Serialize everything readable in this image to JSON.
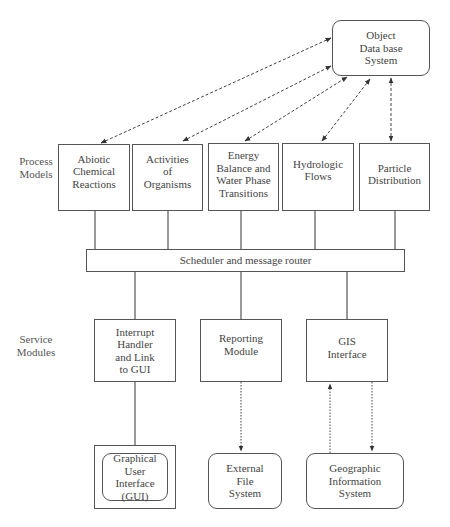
{
  "rows": {
    "process_label": "Process\nModels",
    "service_label": "Service\nModules"
  },
  "database": {
    "label": "Object\nData base\nSystem"
  },
  "process_models": [
    {
      "label": "Abiotic\nChemical\nReactions"
    },
    {
      "label": "Activities\nof\nOrganisms"
    },
    {
      "label": "Energy\nBalance and\nWater Phase\nTransitions"
    },
    {
      "label": "Hydrologic\nFlows"
    },
    {
      "label": "Particle\nDistribution"
    }
  ],
  "router": {
    "label": "Scheduler and message router"
  },
  "service_modules": [
    {
      "label": "Interrupt\nHandler\nand Link\nto GUI"
    },
    {
      "label": "Reporting\nModule"
    },
    {
      "label": "GIS\nInterface"
    }
  ],
  "external": [
    {
      "label": "Graphical\nUser\nInterface\n(GUI)"
    },
    {
      "label": "External\nFile\nSystem"
    },
    {
      "label": "Geographic\nInformation\nSystem"
    }
  ]
}
